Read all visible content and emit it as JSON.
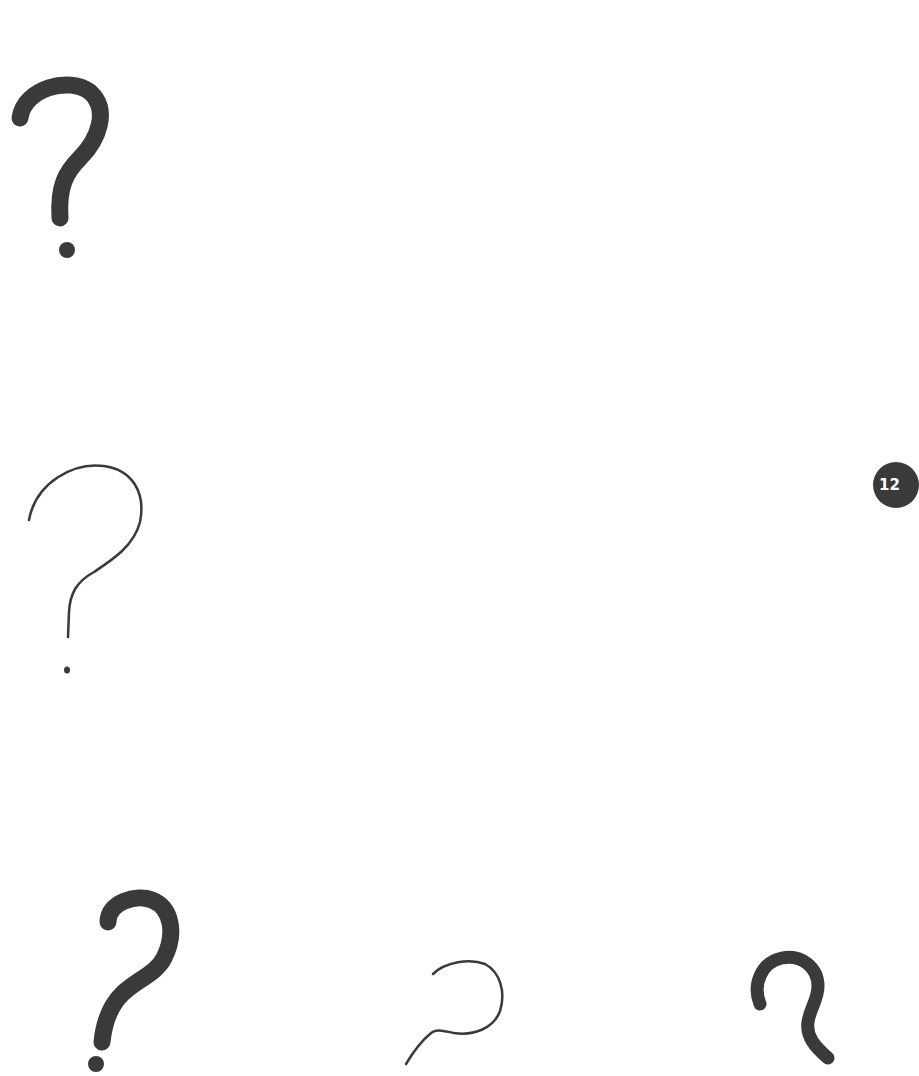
{
  "page": {
    "background": "#ffffff",
    "page_number": "12",
    "badge_color": "#3a3a3a",
    "ink_color": "#3a3a3a"
  },
  "question_marks": [
    {
      "id": "qm-1",
      "style": "bold-hand-drawn",
      "icon": "question-mark-icon"
    },
    {
      "id": "qm-2",
      "style": "thin-hand-drawn",
      "icon": "question-mark-icon"
    },
    {
      "id": "qm-3",
      "style": "bold-hand-drawn",
      "icon": "question-mark-icon"
    },
    {
      "id": "qm-4",
      "style": "thin-hand-drawn",
      "icon": "question-mark-icon"
    },
    {
      "id": "qm-5",
      "style": "bold-hand-drawn",
      "icon": "question-mark-icon"
    }
  ]
}
